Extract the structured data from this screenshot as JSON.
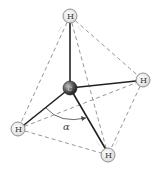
{
  "diagram": {
    "title": "",
    "molecule": "CH4 tetrahedral",
    "atoms": [
      {
        "id": "c",
        "label": "C",
        "x": 70,
        "y": 88,
        "r": 7,
        "type": "carbon"
      },
      {
        "id": "h_top",
        "label": "H",
        "x": 70,
        "y": 16,
        "r": 7,
        "type": "hydrogen"
      },
      {
        "id": "h_right",
        "label": "H",
        "x": 143,
        "y": 80,
        "r": 7,
        "type": "hydrogen"
      },
      {
        "id": "h_left",
        "label": "H",
        "x": 18,
        "y": 129,
        "r": 7,
        "type": "hydrogen"
      },
      {
        "id": "h_bottom",
        "label": "H",
        "x": 108,
        "y": 155,
        "r": 7,
        "type": "hydrogen"
      }
    ],
    "angle_label": "α",
    "colors": {
      "bond": "#222222",
      "dashed_edge": "#888888",
      "hydrogen_fill": "#eeeeee",
      "hydrogen_stroke": "#777777",
      "carbon_fill": "#555555"
    }
  }
}
